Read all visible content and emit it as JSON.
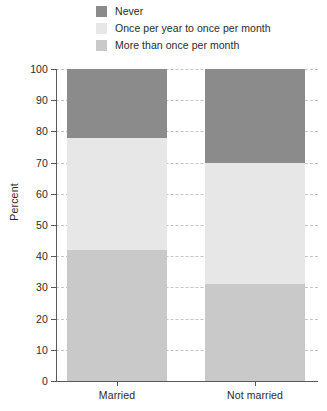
{
  "legend": {
    "position": "top",
    "items": [
      {
        "label": "Never",
        "color": "#8b8b8b",
        "swatch_name": "legend-swatch-never"
      },
      {
        "label": "Once per year to once per month",
        "color": "#e7e7e7",
        "swatch_name": "legend-swatch-once-per-year-to-once-per-month"
      },
      {
        "label": "More than once per month",
        "color": "#c9c9c9",
        "swatch_name": "legend-swatch-more-than-once-per-month"
      }
    ]
  },
  "axes": {
    "ylabel": "Percent",
    "yticks": [
      "100",
      "90",
      "80",
      "70",
      "60",
      "50",
      "40",
      "30",
      "20",
      "10",
      "0"
    ],
    "xticks": [
      "Married",
      "Not married"
    ]
  },
  "chart_data": {
    "type": "bar",
    "subtype": "stacked-100-percent",
    "title": "",
    "subtitle": "",
    "xlabel": "",
    "ylabel": "Percent",
    "ylim": [
      0,
      100
    ],
    "ytick_values": [
      0,
      10,
      20,
      30,
      40,
      50,
      60,
      70,
      80,
      90,
      100
    ],
    "grid": true,
    "grid_axis": "y",
    "grid_style": "dashed",
    "legend_position": "top-left",
    "categories": [
      "Married",
      "Not married"
    ],
    "series": [
      {
        "name": "Never",
        "color": "#8b8b8b",
        "values": [
          22,
          30
        ],
        "cumulative_top": [
          100,
          100
        ],
        "cumulative_bottom": [
          78,
          70
        ]
      },
      {
        "name": "Once per year to once per month",
        "color": "#e7e7e7",
        "values": [
          36,
          39
        ],
        "cumulative_top": [
          78,
          70
        ],
        "cumulative_bottom": [
          42,
          31
        ]
      },
      {
        "name": "More than once per month",
        "color": "#c9c9c9",
        "values": [
          42,
          31
        ],
        "cumulative_top": [
          42,
          31
        ],
        "cumulative_bottom": [
          0,
          0
        ]
      }
    ],
    "annotations": []
  }
}
